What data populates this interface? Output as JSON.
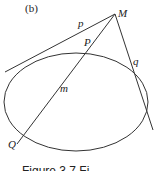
{
  "diagram": {
    "panel_label": "(b)",
    "points": {
      "M": "M",
      "P": "P",
      "Q": "Q"
    },
    "lines": {
      "p": "p",
      "q": "q",
      "m": "m"
    },
    "caption": "Figure 3.7 Fi"
  },
  "colors": {
    "stroke": "#333333",
    "background": "#ffffff"
  }
}
